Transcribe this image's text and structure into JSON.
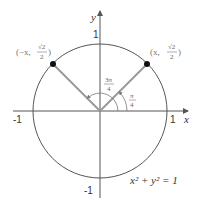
{
  "diagram": {
    "axes": {
      "x_label": "x",
      "y_label": "y",
      "x_ticks": [
        "-1",
        "1"
      ],
      "y_ticks": [
        "1",
        "-1"
      ]
    },
    "equation": "x² + y² = 1",
    "points": [
      {
        "label_prefix": "(x, ",
        "numerator": "√2",
        "denominator": "2",
        "label_suffix": ")",
        "quadrant": "I"
      },
      {
        "label_prefix": "(−x, ",
        "numerator": "√2",
        "denominator": "2",
        "label_suffix": ")",
        "quadrant": "II"
      }
    ],
    "angles": [
      {
        "numerator": "π",
        "denominator": "4"
      },
      {
        "numerator": "3π",
        "denominator": "4"
      }
    ],
    "colors": {
      "circle": "#555555",
      "axes": "#555555",
      "radius_lines": "#999999",
      "points": "#111111"
    }
  }
}
